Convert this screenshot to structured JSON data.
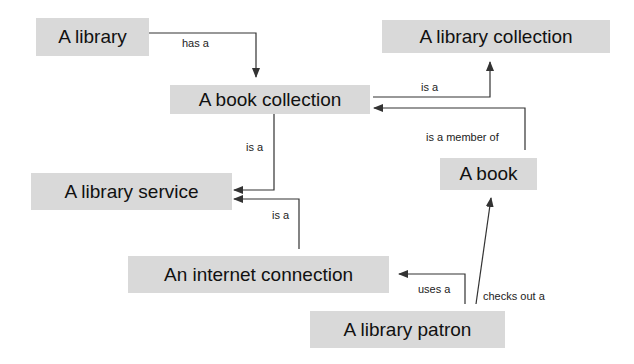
{
  "diagram": {
    "type": "concept-map",
    "nodes": [
      {
        "id": "library",
        "label": "A library"
      },
      {
        "id": "library_collection",
        "label": "A library collection"
      },
      {
        "id": "book_collection",
        "label": "A book collection"
      },
      {
        "id": "library_service",
        "label": "A library service"
      },
      {
        "id": "book",
        "label": "A book"
      },
      {
        "id": "internet_connection",
        "label": "An internet connection"
      },
      {
        "id": "library_patron",
        "label": "A library patron"
      }
    ],
    "edges": [
      {
        "from": "library",
        "to": "book_collection",
        "label": "has a"
      },
      {
        "from": "book_collection",
        "to": "library_collection",
        "label": "is a"
      },
      {
        "from": "book",
        "to": "book_collection",
        "label": "is a member of"
      },
      {
        "from": "book_collection",
        "to": "library_service",
        "label": "is a"
      },
      {
        "from": "internet_connection",
        "to": "library_service",
        "label": "is a"
      },
      {
        "from": "library_patron",
        "to": "internet_connection",
        "label": "uses a"
      },
      {
        "from": "library_patron",
        "to": "book",
        "label": "checks out a"
      }
    ]
  },
  "colors": {
    "node_fill": "#d9d9d9",
    "line": "#333333",
    "text": "#111111"
  }
}
